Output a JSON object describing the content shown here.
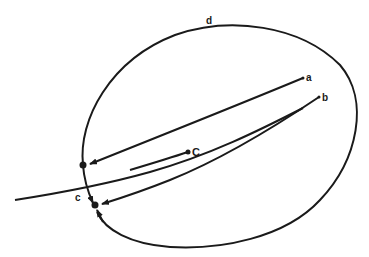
{
  "diagram": {
    "labels": {
      "a": "a",
      "b": "b",
      "C": "C",
      "c": "c",
      "d": "d"
    },
    "stroke_color": "#1a1a1a",
    "background": "#ffffff",
    "elements": [
      {
        "id": "d",
        "type": "closed-curve",
        "label": "d"
      },
      {
        "id": "a-line",
        "type": "arrow",
        "from_label": "a",
        "to": "upper-dot"
      },
      {
        "id": "b-line",
        "type": "arrow",
        "from_label": "b",
        "to": "lower-dot"
      },
      {
        "id": "C-line",
        "type": "line",
        "from_label": "C"
      },
      {
        "id": "c-curve",
        "type": "open-curve",
        "label": "c"
      }
    ]
  }
}
